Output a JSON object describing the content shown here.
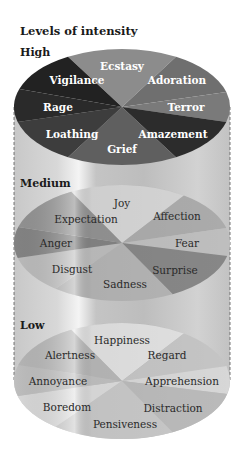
{
  "title": "Levels of intensity",
  "levels": [
    {
      "name": "High",
      "slices": [
        {
          "label": "Ecstasy",
          "color": "#8c8c8c"
        },
        {
          "label": "Adoration",
          "color": "#6f6f6f"
        },
        {
          "label": "Terror",
          "color": "#7a7a7a"
        },
        {
          "label": "Amazement",
          "color": "#2c2c2c"
        },
        {
          "label": "Grief",
          "color": "#5f5f5f"
        },
        {
          "label": "Loathing",
          "color": "#3d3d3d"
        },
        {
          "label": "Rage",
          "color": "#2a2a2a"
        },
        {
          "label": "Vigilance",
          "color": "#222222"
        }
      ]
    },
    {
      "name": "Medium",
      "slices": [
        {
          "label": "Joy",
          "color": "#e0e0e0"
        },
        {
          "label": "Affection",
          "color": "#b4b4b4"
        },
        {
          "label": "Fear",
          "color": "#c8c8c8"
        },
        {
          "label": "Surprise",
          "color": "#8e8e8e"
        },
        {
          "label": "Sadness",
          "color": "#bdbdbd"
        },
        {
          "label": "Disgust",
          "color": "#c6c6c6"
        },
        {
          "label": "Anger",
          "color": "#8a8a8a"
        },
        {
          "label": "Expectation",
          "color": "#9a9a9a"
        }
      ]
    },
    {
      "name": "Low",
      "slices": [
        {
          "label": "Happiness",
          "color": "#ececec"
        },
        {
          "label": "Regard",
          "color": "#cfcfcf"
        },
        {
          "label": "Apprehension",
          "color": "#e2e2e2"
        },
        {
          "label": "Distraction",
          "color": "#c4c4c4"
        },
        {
          "label": "Pensiveness",
          "color": "#d2d2d2"
        },
        {
          "label": "Boredom",
          "color": "#e6e6e6"
        },
        {
          "label": "Annoyance",
          "color": "#c9c9c9"
        },
        {
          "label": "Alertness",
          "color": "#c0c0c0"
        }
      ]
    }
  ]
}
